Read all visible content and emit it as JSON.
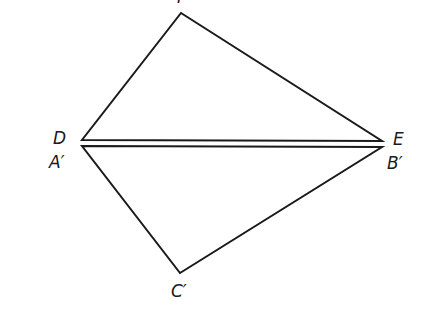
{
  "diagram": {
    "type": "geometry-figure",
    "stroke_color": "#1a1a1a",
    "background": "#ffffff",
    "points": {
      "F": {
        "label": "F",
        "x": 181,
        "y": 13
      },
      "D": {
        "label": "D",
        "x": 82,
        "y": 140
      },
      "E": {
        "label": "E",
        "x": 382,
        "y": 141
      },
      "A_prime": {
        "label": "A′",
        "x": 82,
        "y": 146
      },
      "B_prime": {
        "label": "B′",
        "x": 382,
        "y": 147
      },
      "C_prime": {
        "label": "C′",
        "x": 180,
        "y": 273
      }
    },
    "triangles": [
      {
        "name": "DEF",
        "vertices": [
          "D",
          "E",
          "F"
        ]
      },
      {
        "name": "A'B'C'",
        "vertices": [
          "A_prime",
          "B_prime",
          "C_prime"
        ]
      }
    ],
    "labels": {
      "top": "F",
      "d": "D",
      "e": "E",
      "a_prime": "A′",
      "b_prime": "B′",
      "c_prime": "C′"
    }
  }
}
